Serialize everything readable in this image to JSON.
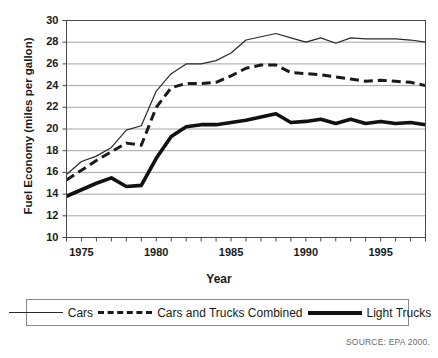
{
  "chart_data": {
    "type": "line",
    "title": "",
    "xlabel": "Year",
    "ylabel": "Fuel Economy (miles per gallon)",
    "xlim": [
      1974,
      1998
    ],
    "ylim": [
      10,
      30
    ],
    "xticks": [
      1975,
      1980,
      1985,
      1990,
      1995
    ],
    "yticks": [
      10,
      12,
      14,
      16,
      18,
      20,
      22,
      24,
      26,
      28,
      30
    ],
    "grid": true,
    "legend_position": "bottom",
    "source": "SOURCE: EPA 2000.",
    "x": [
      1974,
      1975,
      1976,
      1977,
      1978,
      1979,
      1980,
      1981,
      1982,
      1983,
      1984,
      1985,
      1986,
      1987,
      1988,
      1989,
      1990,
      1991,
      1992,
      1993,
      1994,
      1995,
      1996,
      1997,
      1998
    ],
    "series": [
      {
        "name": "Cars",
        "style": "solid-thin",
        "color": "#2a2a2a",
        "values": [
          15.8,
          17.0,
          17.5,
          18.3,
          19.9,
          20.3,
          23.5,
          25.1,
          26.0,
          26.0,
          26.3,
          27.0,
          28.2,
          28.5,
          28.8,
          28.4,
          28.0,
          28.4,
          27.9,
          28.4,
          28.3,
          28.3,
          28.3,
          28.2,
          28.0
        ]
      },
      {
        "name": "Cars and Trucks Combined",
        "style": "dashed",
        "color": "#1a1a1a",
        "values": [
          15.3,
          16.2,
          17.1,
          17.9,
          18.7,
          18.5,
          22.0,
          23.8,
          24.2,
          24.2,
          24.3,
          24.9,
          25.6,
          25.9,
          25.9,
          25.2,
          25.1,
          25.0,
          24.8,
          24.6,
          24.4,
          24.5,
          24.4,
          24.3,
          24.0
        ]
      },
      {
        "name": "Light Trucks",
        "style": "solid-thick",
        "color": "#111111",
        "values": [
          13.8,
          14.4,
          15.0,
          15.5,
          14.7,
          14.8,
          17.3,
          19.3,
          20.2,
          20.4,
          20.4,
          20.6,
          20.8,
          21.1,
          21.4,
          20.6,
          20.7,
          20.9,
          20.5,
          20.9,
          20.5,
          20.7,
          20.5,
          20.6,
          20.4
        ]
      }
    ]
  },
  "labels": {
    "x_axis_title": "Year",
    "y_axis_title": "Fuel Economy (miles per gallon)",
    "source_note": "SOURCE: EPA 2000."
  },
  "legend": {
    "items": [
      {
        "label": "Cars"
      },
      {
        "label": "Cars and Trucks Combined"
      },
      {
        "label": "Light Trucks"
      }
    ]
  },
  "colors": {
    "cars": "#2a2a2a",
    "combined": "#1a1a1a",
    "light_trucks": "#111111",
    "grid": "#9a9a9a",
    "axis": "#4a4a4a",
    "legend_border": "#8a8a8a",
    "source_text": "#6b6b6b"
  }
}
